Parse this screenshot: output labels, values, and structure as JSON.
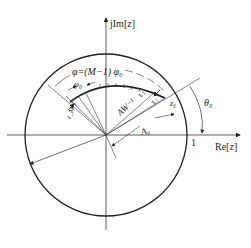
{
  "diagram": {
    "axes": {
      "imag_label": "jIm[z]",
      "real_label": "Re[z]",
      "unit_tick_label": "1"
    },
    "labels": {
      "phi_total": "φ=(M−1) φ₀",
      "phi0": "φ₀",
      "theta0": "θ₀",
      "A0": "A₀",
      "AW": "AW⁻¹",
      "z0": "z₀",
      "z1": "z₁",
      "z2": "z₂",
      "zM1": "z_M-1"
    },
    "colors": {
      "line": "#222222",
      "background": "#ffffff"
    }
  }
}
